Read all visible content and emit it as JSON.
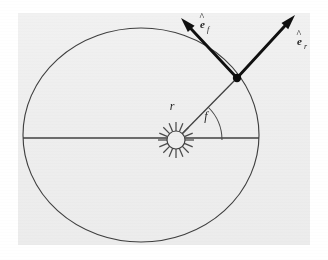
{
  "figure": {
    "kind": "orbital-mechanics-diagram",
    "caption_text": "",
    "background_color": "#ffffff",
    "panel_color": "#eeeeee",
    "ink_color": "#3a3a3a",
    "arrow_color": "#111111",
    "panel": {
      "x": 18,
      "y": 13,
      "width": 292,
      "height": 232
    },
    "labels": {
      "radius": "r",
      "true_anomaly": "f",
      "unit_vector_transverse": "e",
      "unit_vector_transverse_sub": "f",
      "unit_vector_radial": "e",
      "unit_vector_radial_sub": "r",
      "hat_accent": "^"
    },
    "geometry": {
      "ellipse": {
        "cx": 141,
        "cy": 135,
        "rx": 118,
        "ry": 107
      },
      "major_axis_line": {
        "x1": 23,
        "y1": 138,
        "x2": 259,
        "y2": 138
      },
      "focus_sun": {
        "cx": 176,
        "cy": 140,
        "r": 9,
        "ray_count": 16,
        "ray_length": 9
      },
      "orbiting_body": {
        "cx": 237,
        "cy": 78,
        "r": 4.2
      },
      "radius_vector": {
        "x1": 176,
        "y1": 140,
        "x2": 237,
        "y2": 78
      },
      "angle_arc": {
        "cx": 176,
        "cy": 140,
        "radius": 46,
        "start_deg": 0,
        "end_deg": 45
      },
      "arrow_transverse": {
        "x1": 237,
        "y1": 78,
        "x2": 181,
        "y2": 18
      },
      "arrow_radial": {
        "x1": 237,
        "y1": 78,
        "x2": 295,
        "y2": 15
      }
    },
    "label_positions": {
      "radius": {
        "x": 172,
        "y": 110
      },
      "true_anomaly": {
        "x": 206,
        "y": 120
      },
      "unit_vector_transverse": {
        "x": 199,
        "y": 26
      },
      "unit_vector_radial": {
        "x": 296,
        "y": 44
      }
    }
  },
  "chart_data": {
    "type": "scatter",
    "title": "",
    "xlabel": "",
    "ylabel": "",
    "annotations": [
      "r",
      "f",
      "e_f",
      "e_r"
    ]
  }
}
